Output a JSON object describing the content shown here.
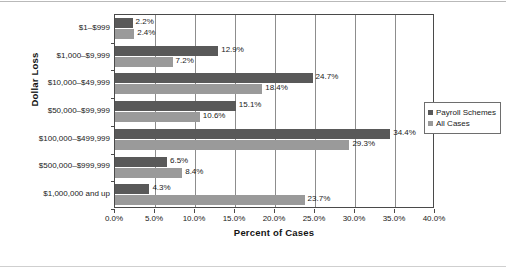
{
  "chart_data": {
    "type": "bar",
    "orientation": "horizontal",
    "title": "",
    "xlabel": "Percent of Cases",
    "ylabel": "Dollar Loss",
    "xlim": [
      0,
      40
    ],
    "xticks": [
      "0.0%",
      "5.0%",
      "10.0%",
      "15.0%",
      "20.0%",
      "25.0%",
      "30.0%",
      "35.0%",
      "40.0%"
    ],
    "xtick_values": [
      0,
      5,
      10,
      15,
      20,
      25,
      30,
      35,
      40
    ],
    "grid": true,
    "legend_position": "right",
    "categories": [
      "$1–$999",
      "$1,000–$9,999",
      "$10,000–$49,999",
      "$50,000–$99,999",
      "$100,000–$499,999",
      "$500,000–$999,999",
      "$1,000,000 and up"
    ],
    "series": [
      {
        "name": "Payroll Schemes",
        "color": "#595959",
        "values": [
          2.2,
          12.9,
          24.7,
          15.1,
          34.4,
          6.5,
          4.3
        ],
        "labels": [
          "2.2%",
          "12.9%",
          "24.7%",
          "15.1%",
          "34.4%",
          "6.5%",
          "4.3%"
        ]
      },
      {
        "name": "All Cases",
        "color": "#9a9a9a",
        "values": [
          2.4,
          7.2,
          18.4,
          10.6,
          29.3,
          8.4,
          23.7
        ],
        "labels": [
          "2.4%",
          "7.2%",
          "18.4%",
          "10.6%",
          "29.3%",
          "8.4%",
          "23.7%"
        ]
      }
    ]
  },
  "legend": {
    "items": [
      {
        "label": "Payroll Schemes",
        "color": "#595959"
      },
      {
        "label": "All Cases",
        "color": "#9a9a9a"
      }
    ]
  }
}
